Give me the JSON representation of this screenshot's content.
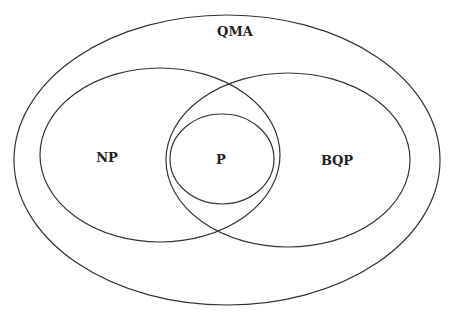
{
  "diagram": {
    "type": "venn",
    "sets": [
      {
        "id": "qma",
        "label": "QMA",
        "cx": 227,
        "cy": 160,
        "rx": 213,
        "ry": 145,
        "label_x": 235,
        "label_y": 32
      },
      {
        "id": "np",
        "label": "NP",
        "cx": 160,
        "cy": 155,
        "rx": 120,
        "ry": 87,
        "label_x": 107,
        "label_y": 158
      },
      {
        "id": "bqp",
        "label": "BQP",
        "cx": 288,
        "cy": 160,
        "rx": 122,
        "ry": 87,
        "label_x": 337,
        "label_y": 161
      },
      {
        "id": "p",
        "label": "P",
        "cx": 222,
        "cy": 159,
        "rx": 52,
        "ry": 45,
        "label_x": 221,
        "label_y": 160
      }
    ],
    "colors": {
      "stroke": "#333333",
      "text": "#222222",
      "background": "#ffffff"
    }
  }
}
